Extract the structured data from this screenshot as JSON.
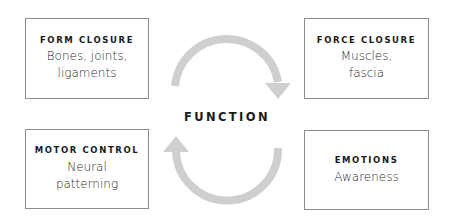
{
  "diagram": {
    "center": {
      "label": "FUNCTION"
    },
    "boxes": [
      {
        "id": "form-closure",
        "title": "FORM CLOSURE",
        "lines": [
          "Bones, joints,",
          "ligaments"
        ],
        "position": "top-left"
      },
      {
        "id": "force-closure",
        "title": "FORCE CLOSURE",
        "lines": [
          "Muscles,",
          "fascia"
        ],
        "position": "top-right"
      },
      {
        "id": "motor-control",
        "title": "MOTOR CONTROL",
        "lines": [
          "Neural",
          "patterning"
        ],
        "position": "bottom-left"
      },
      {
        "id": "emotions",
        "title": "EMOTIONS",
        "lines": [
          "Awareness"
        ],
        "position": "bottom-right"
      }
    ],
    "arrows": [
      {
        "id": "top-arrow",
        "direction": "clockwise",
        "from": "left",
        "to": "right",
        "head": "down"
      },
      {
        "id": "bottom-arrow",
        "direction": "clockwise",
        "from": "right",
        "to": "left",
        "head": "up"
      }
    ],
    "colors": {
      "arrow": "#cfcfcf",
      "border": "#8c8c8c",
      "text": "#1a1a1a"
    }
  }
}
